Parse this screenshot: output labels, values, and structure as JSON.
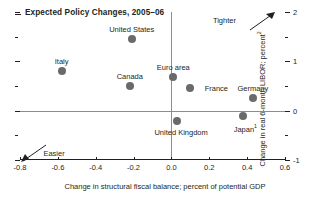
{
  "chart_data": {
    "type": "scatter",
    "title": "Expected Policy Changes, 2005–06",
    "xlabel": "Change in structural fiscal balance; percent of potential GDP",
    "ylabel": "Change in real 6-month LIBOR; percent",
    "ylabel_sup": "2",
    "xlim": [
      -0.8,
      0.6
    ],
    "ylim": [
      -1,
      2
    ],
    "xticks": [
      "-0.8",
      "-0.6",
      "-0.4",
      "-0.2",
      "0.0",
      "0.2",
      "0.4",
      "0.6"
    ],
    "xtick_values": [
      -0.8,
      -0.6,
      -0.4,
      -0.2,
      0.0,
      0.2,
      0.4,
      0.6
    ],
    "yticks": [
      "2",
      "1",
      "0",
      "-1"
    ],
    "ytick_values": [
      2,
      1,
      0,
      -1
    ],
    "yminor_values": [
      1.5,
      0.5,
      -0.5
    ],
    "grid": false,
    "legend": "none",
    "zero_line_y": 0,
    "zero_line_x": 0,
    "points": [
      {
        "name": "United States",
        "x": -0.21,
        "y": 1.45,
        "label_dx": 0,
        "label_dy": -14
      },
      {
        "name": "Italy",
        "x": -0.58,
        "y": 0.8,
        "label_dx": 0,
        "label_dy": -14
      },
      {
        "name": "Canada",
        "x": -0.22,
        "y": 0.5,
        "label_dx": 0,
        "label_dy": -14
      },
      {
        "name": "Euro area",
        "x": 0.01,
        "y": 0.68,
        "label_dx": 0,
        "label_dy": -14
      },
      {
        "name": "France",
        "x": 0.1,
        "y": 0.46,
        "label_dx": 26,
        "label_dy": -4
      },
      {
        "name": "Germany",
        "x": 0.43,
        "y": 0.25,
        "label_dx": 0,
        "label_dy": -14
      },
      {
        "name": "United Kingdom",
        "x": 0.03,
        "y": -0.2,
        "label_dx": 4,
        "label_dy": 7
      },
      {
        "name": "Japan",
        "x": 0.38,
        "y": -0.1,
        "label_dx": 2,
        "label_dy": 7,
        "sup": "1"
      }
    ],
    "annotations": [
      {
        "name": "tighter",
        "text": "Tighter",
        "x": 0.28,
        "y": 1.83,
        "direction": "up-right"
      },
      {
        "name": "easier",
        "text": "Easier",
        "x": -0.62,
        "y": -0.86,
        "direction": "down-left"
      }
    ],
    "marker_color": "#6a6a6a",
    "axis_color": "#231f20",
    "zero_line_color": "#8d8d8d"
  }
}
